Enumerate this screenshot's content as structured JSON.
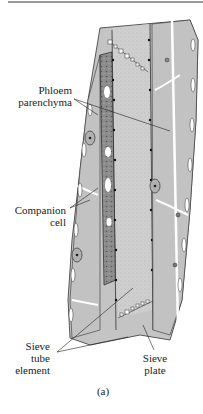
{
  "figure": {
    "caption": "(a)",
    "colors": {
      "cell_fill": "#c4c4c4",
      "sieve_tube_fill": "#cdcdcd",
      "companion_fill": "#8a8a8a",
      "wall": "#ffffff",
      "outline": "#2a2a2a"
    }
  },
  "labels": {
    "phloem_parenchyma": {
      "line1": "Phloem",
      "line2": "parenchyma"
    },
    "companion_cell": {
      "line1": "Companion",
      "line2": "cell"
    },
    "sieve_tube_element": {
      "line1": "Sieve",
      "line2": "tube",
      "line3": "element"
    },
    "sieve_plate": {
      "line1": "Sieve",
      "line2": "plate"
    }
  }
}
